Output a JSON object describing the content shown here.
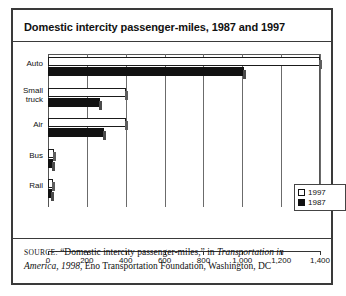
{
  "figure": {
    "title": "Domestic intercity passenger-miles, 1987 and 1997",
    "source": {
      "prefix": "SOURCE:",
      "quoted": "“Domestic intercity passenger-miles,”",
      "connector": "in",
      "italic_title": "Transportation in America, 1998",
      "tail": ", Eno Transportation Foundation, Washington, DC"
    }
  },
  "legend": {
    "position": "bottom-right",
    "entries": [
      {
        "label": "1997",
        "swatch": "white-square",
        "color": "#ffffff"
      },
      {
        "label": "1987",
        "swatch": "black-square",
        "color": "#111111"
      }
    ]
  },
  "chart_data": {
    "type": "bar",
    "orientation": "horizontal",
    "title": "Domestic intercity passenger-miles, 1987 and 1997",
    "xlabel": "",
    "ylabel": "",
    "categories": [
      "Auto",
      "Small truck",
      "Air",
      "Bus",
      "Rail"
    ],
    "series": [
      {
        "name": "1997",
        "color": "#ffffff",
        "values": [
          1400,
          400,
          400,
          30,
          25
        ]
      },
      {
        "name": "1987",
        "color": "#111111",
        "values": [
          1010,
          270,
          290,
          25,
          20
        ]
      }
    ],
    "xlim": [
      0,
      1400
    ],
    "xticks": [
      0,
      200,
      400,
      600,
      800,
      1000,
      1200,
      1400
    ],
    "xticklabels": [
      "0",
      "200",
      "400",
      "600",
      "800",
      "1,000",
      "1,200",
      "1,400"
    ],
    "grid": "vertical",
    "legend_position": "lower right"
  }
}
